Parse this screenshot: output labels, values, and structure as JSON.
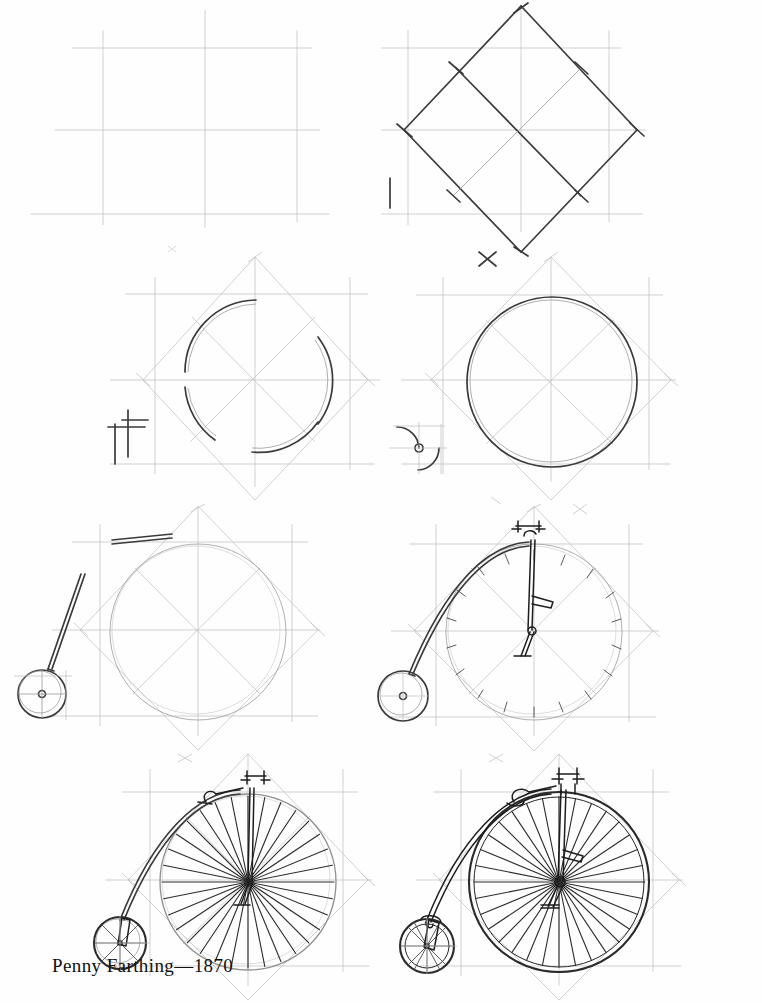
{
  "document": {
    "type": "drawing-tutorial",
    "subject": "Penny Farthing bicycle",
    "caption": "Penny Farthing— 1870",
    "caption_text": "Penny Farthing—1870",
    "background_color": "#fefefe",
    "construction_line_color": "#bdbdbd",
    "drawing_line_color": "#1d1d1d",
    "page_width": 762,
    "page_height": 1003
  },
  "layout": {
    "columns": 2,
    "rows": 4,
    "total_steps": 8,
    "caption_position": "bottom-left"
  },
  "steps": [
    {
      "number": "1",
      "name": "construction-square",
      "description": "Light pencil square with horizontal and vertical center lines extending past the corners"
    },
    {
      "number": "2",
      "name": "inscribed-diamond",
      "description": "Dark diamond (square rotated 45 degrees) drawn over the light square with its diagonals"
    },
    {
      "number": "3",
      "name": "corner-arcs",
      "description": "Arc segments sketched in the corner regions between diamond vertices to begin the wheel circle"
    },
    {
      "number": "4",
      "name": "completed-large-wheel-circle",
      "description": "Full large wheel circle completed; small wheel construction arcs and hub begun at lower left"
    },
    {
      "number": "5",
      "name": "small-wheel-and-backbone",
      "description": "Small rear wheel added at lower left and frame backbone tube drawn up to the top of the big wheel"
    },
    {
      "number": "6",
      "name": "handlebars-saddle-pedal",
      "description": "Handlebars, seat post with saddle, pedal crank added; short spoke marks sketched around the rim"
    },
    {
      "number": "7",
      "name": "spokes-filled",
      "description": "All spokes drawn on the large wheel radiating from the hub"
    },
    {
      "number": "8",
      "name": "finished-penny-farthing",
      "description": "Finished drawing with darkened outlines, both wheels spoked, saddle, handlebars, fork and pedal"
    }
  ],
  "drawing_details": {
    "large_wheel_spoke_count": 32,
    "small_wheel_spoke_count": 12,
    "parts": [
      "large front wheel",
      "small rear wheel",
      "backbone frame",
      "handlebars",
      "saddle",
      "pedal crank",
      "front fork",
      "rear fork"
    ]
  }
}
